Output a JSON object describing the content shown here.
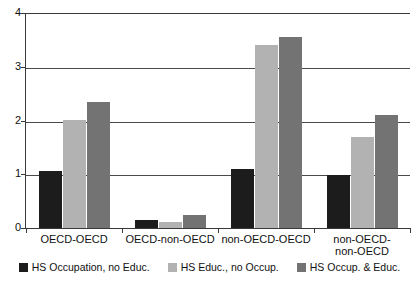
{
  "chart_data": {
    "type": "bar",
    "title": "",
    "subtitle": "",
    "xlabel": "",
    "ylabel": "",
    "ylim": [
      0,
      4
    ],
    "yticks": [
      "0",
      "1",
      "2",
      "3",
      "4"
    ],
    "grid": true,
    "legend_position": "bottom",
    "categories": [
      "OECD-OECD",
      "OECD-non-OECD",
      "non-OECD-OECD",
      "non-OECD-\nnon-OECD"
    ],
    "series": [
      {
        "name": "HS Occupation, no Educ.",
        "color": "#1c1c1c",
        "values": [
          1.07,
          0.15,
          1.1,
          0.99
        ]
      },
      {
        "name": "HS Educ., no Occup.",
        "color": "#b2b2b2",
        "values": [
          2.01,
          0.11,
          3.4,
          1.69
        ]
      },
      {
        "name": "HS Occup. & Educ.",
        "color": "#737373",
        "values": [
          2.35,
          0.25,
          3.55,
          2.11
        ]
      }
    ]
  }
}
